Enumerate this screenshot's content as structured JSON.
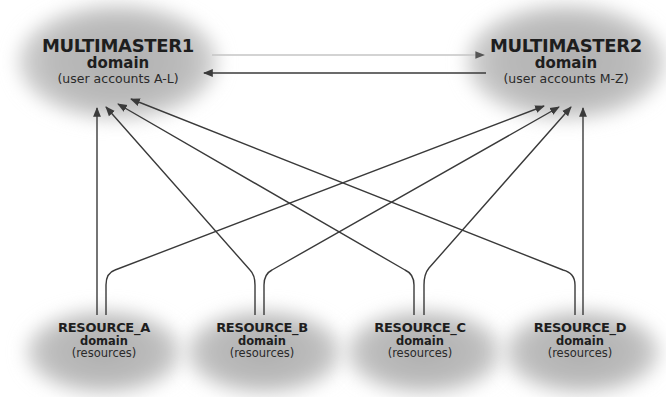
{
  "diagram": {
    "colors": {
      "cloud": "#b4b4b4",
      "line": "#3a3a3a",
      "faint_line": "#b8b8b8",
      "text": "#1e1e1e",
      "background": "#ffffff"
    },
    "masters": [
      {
        "id": "mm1",
        "title": "MULTIMASTER1",
        "subtitle": "domain",
        "description": "(user accounts A-L)"
      },
      {
        "id": "mm2",
        "title": "MULTIMASTER2",
        "subtitle": "domain",
        "description": "(user accounts M-Z)"
      }
    ],
    "resources": [
      {
        "id": "ra",
        "title": "RESOURCE_A",
        "subtitle": "domain",
        "description": "(resources)"
      },
      {
        "id": "rb",
        "title": "RESOURCE_B",
        "subtitle": "domain",
        "description": "(resources)"
      },
      {
        "id": "rc",
        "title": "RESOURCE_C",
        "subtitle": "domain",
        "description": "(resources)"
      },
      {
        "id": "rd",
        "title": "RESOURCE_D",
        "subtitle": "domain",
        "description": "(resources)"
      }
    ],
    "edges": [
      {
        "from": "MULTIMASTER1",
        "to": "MULTIMASTER2",
        "style": "faint"
      },
      {
        "from": "MULTIMASTER2",
        "to": "MULTIMASTER1",
        "style": "solid"
      },
      {
        "from": "RESOURCE_A",
        "to": "MULTIMASTER1",
        "style": "solid"
      },
      {
        "from": "RESOURCE_A",
        "to": "MULTIMASTER2",
        "style": "solid"
      },
      {
        "from": "RESOURCE_B",
        "to": "MULTIMASTER1",
        "style": "solid"
      },
      {
        "from": "RESOURCE_B",
        "to": "MULTIMASTER2",
        "style": "solid"
      },
      {
        "from": "RESOURCE_C",
        "to": "MULTIMASTER1",
        "style": "solid"
      },
      {
        "from": "RESOURCE_C",
        "to": "MULTIMASTER2",
        "style": "solid"
      },
      {
        "from": "RESOURCE_D",
        "to": "MULTIMASTER1",
        "style": "solid"
      },
      {
        "from": "RESOURCE_D",
        "to": "MULTIMASTER2",
        "style": "solid"
      }
    ]
  }
}
